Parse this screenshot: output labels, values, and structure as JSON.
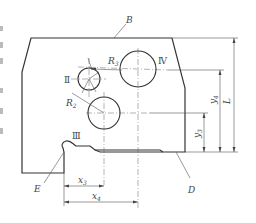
{
  "figure": {
    "stroke_color": "#333333",
    "background": "#ffffff"
  },
  "labels": {
    "edge_top": "B",
    "edge_bottom": "D",
    "notch": "E",
    "hole_2": "Ⅱ",
    "hole_3": "Ⅲ",
    "hole_4": "Ⅳ",
    "radius_2": {
      "main": "R",
      "sub": "2"
    },
    "radius_3": {
      "main": "R",
      "sub": "3"
    }
  },
  "dimensions": {
    "x3": {
      "main": "x",
      "sub": "3"
    },
    "x4": {
      "main": "x",
      "sub": "4"
    },
    "y3": {
      "main": "y",
      "sub": "3"
    },
    "y4": {
      "main": "y",
      "sub": "4"
    },
    "L": "L"
  }
}
